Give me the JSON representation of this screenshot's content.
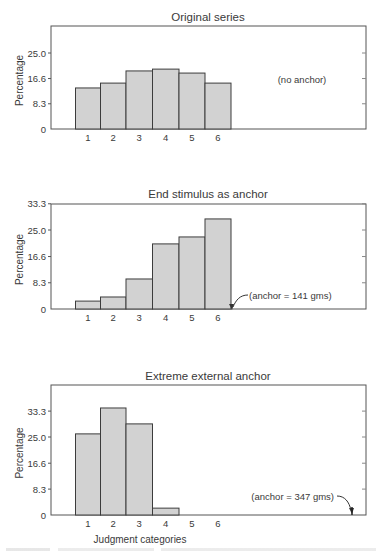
{
  "chart_data": [
    {
      "type": "bar",
      "title": "Original series",
      "xlabel": "",
      "ylabel": "Percentage",
      "categories": [
        "1",
        "2",
        "3",
        "4",
        "5",
        "6"
      ],
      "values": [
        13.5,
        15.1,
        19.1,
        19.7,
        18.4,
        15.1
      ],
      "yticks": [
        "0",
        "8.3",
        "16.6",
        "25.0"
      ],
      "ytick_values": [
        0,
        8.3,
        16.6,
        25.0
      ],
      "ylim": [
        0,
        33.3
      ],
      "annotation": "(no anchor)",
      "grid": false
    },
    {
      "type": "bar",
      "title": "End stimulus as anchor",
      "xlabel": "",
      "ylabel": "Percentage",
      "categories": [
        "1",
        "2",
        "3",
        "4",
        "5",
        "6"
      ],
      "values": [
        2.5,
        3.8,
        9.5,
        20.6,
        22.8,
        28.5
      ],
      "yticks": [
        "0",
        "8.3",
        "16.6",
        "25.0",
        "33.3"
      ],
      "ytick_values": [
        0,
        8.3,
        16.6,
        25.0,
        33.3
      ],
      "ylim": [
        0,
        33.3
      ],
      "annotation": "(anchor = 141 gms)",
      "grid": false
    },
    {
      "type": "bar",
      "title": "Extreme external anchor",
      "xlabel": "Judgment categories",
      "ylabel": "Percentage",
      "categories": [
        "1",
        "2",
        "3",
        "4",
        "5",
        "6"
      ],
      "values": [
        26.0,
        34.3,
        29.2,
        2.2,
        0,
        0
      ],
      "yticks": [
        "0",
        "8.3",
        "16.6",
        "25.0",
        "33.3"
      ],
      "ytick_values": [
        0,
        8.3,
        16.6,
        25.0,
        33.3
      ],
      "ylim": [
        0,
        41.6
      ],
      "annotation": "(anchor = 347 gms)",
      "grid": false
    }
  ],
  "style": {
    "bar_fill": "#d2d2d2",
    "bar_stroke": "#3c3c3c",
    "frame_stroke": "#555555",
    "text_color": "#3a3a3a"
  }
}
